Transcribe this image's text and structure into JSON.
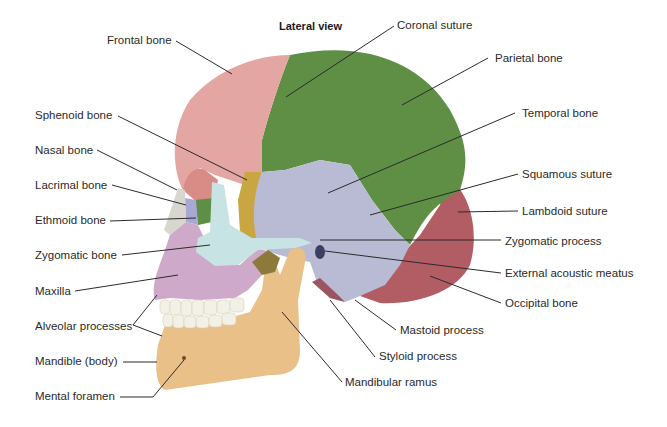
{
  "title": "Lateral view",
  "colors": {
    "frontal": "#e3a6a2",
    "parietal": "#5f8f45",
    "temporal": "#b9bad4",
    "occipital": "#b25d63",
    "sphenoid": "#c9a642",
    "zygomatic": "#c8e3e4",
    "maxilla": "#cfa9c9",
    "mandible": "#e8c088",
    "ethmoid": "#5e8f46",
    "lacrimal": "#a7a9d3",
    "nasal": "#d7d7cf",
    "teeth": "#f3f1e6",
    "leader": "#2b2b2b"
  },
  "labels": {
    "frontal_bone": "Frontal bone",
    "coronal_suture": "Coronal suture",
    "parietal_bone": "Parietal bone",
    "temporal_bone": "Temporal bone",
    "sphenoid_bone": "Sphenoid bone",
    "nasal_bone": "Nasal bone",
    "lacrimal_bone": "Lacrimal bone",
    "ethmoid_bone": "Ethmoid bone",
    "zygomatic_bone": "Zygomatic bone",
    "maxilla": "Maxilla",
    "alveolar_processes": "Alveolar processes",
    "mandible_body": "Mandible (body)",
    "mental_foramen": "Mental foramen",
    "squamous_suture": "Squamous suture",
    "lambdoid_suture": "Lambdoid suture",
    "zygomatic_process": "Zygomatic process",
    "external_acoustic_meatus": "External acoustic meatus",
    "occipital_bone": "Occipital bone",
    "mastoid_process": "Mastoid process",
    "styloid_process": "Styloid process",
    "mandibular_ramus": "Mandibular ramus"
  }
}
